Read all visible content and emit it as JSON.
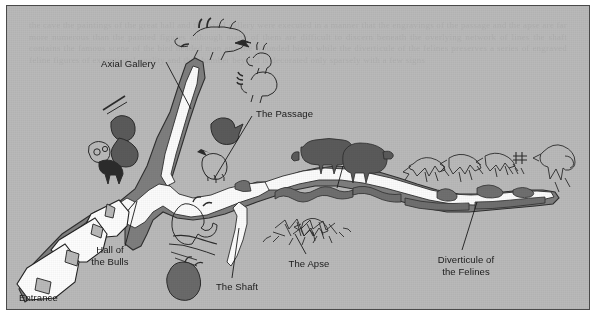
{
  "figure": {
    "kind": "map",
    "background_color": "#b9b9b9",
    "border_color": "#4a4a4a",
    "passage_fill": "#fbfbfb",
    "rock_fill": "#7e7e7e",
    "art_dark_fill": "#5d5d5d",
    "ink_color": "#2f2f2f"
  },
  "labels": [
    {
      "id": "axial-gallery",
      "text": "Axial Gallery",
      "x": 94,
      "y": 58,
      "align": "left"
    },
    {
      "id": "the-passage",
      "text": "The Passage",
      "x": 249,
      "y": 108,
      "align": "left"
    },
    {
      "id": "hall-of-bulls",
      "text": "Hall of\nthe Bulls",
      "x": 103,
      "y": 250,
      "align": "center"
    },
    {
      "id": "entrance",
      "text": "Entrance",
      "x": 18,
      "y": 292,
      "align": "left"
    },
    {
      "id": "the-shaft",
      "text": "The Shaft",
      "x": 228,
      "y": 282,
      "align": "center"
    },
    {
      "id": "the-apse",
      "text": "The Apse",
      "x": 302,
      "y": 259,
      "align": "center"
    },
    {
      "id": "diverticule",
      "text": "Diverticule of\nthe Felines",
      "x": 459,
      "y": 254,
      "align": "center"
    }
  ],
  "regions": [
    "Entrance",
    "Hall of the Bulls",
    "Axial Gallery",
    "The Passage",
    "The Shaft",
    "The Apse",
    "Diverticule of the Felines"
  ],
  "ghost_text": "the cave the paintings of the great hall and the axial gallery were executed in a manner that the engravings of the passage and the apse are far more numerous than the painted figures although many of them are difficult to discern beneath the overlying network of lines the shaft contains the famous scene of the bird headed man and the wounded bison while the diverticule of the felines preserves a series of engraved feline figures of exceptional quality and the chamber beyond is decorated only sparsely with a few signs"
}
